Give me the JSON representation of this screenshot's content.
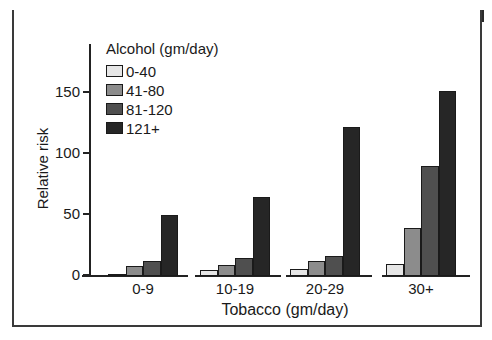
{
  "chart_data": {
    "type": "bar",
    "title": "",
    "xlabel": "Tobacco (gm/day)",
    "ylabel": "Relative risk",
    "ylim": [
      0,
      185
    ],
    "yticks": [
      0,
      50,
      100,
      150
    ],
    "grid": false,
    "legend_position": "top-left",
    "legend_title": "Alcohol (gm/day)",
    "categories": [
      "0-9",
      "10-19",
      "20-29",
      "30+"
    ],
    "series": [
      {
        "name": "0-40",
        "color": "#e6e6e6",
        "values": [
          1,
          5,
          6,
          10
        ]
      },
      {
        "name": "41-80",
        "color": "#8c8c8c",
        "values": [
          8,
          9,
          12,
          39
        ]
      },
      {
        "name": "81-120",
        "color": "#4f4f4f",
        "values": [
          12,
          15,
          16,
          90
        ]
      },
      {
        "name": "121+",
        "color": "#262626",
        "values": [
          50,
          65,
          122,
          152
        ]
      }
    ]
  },
  "labels": {
    "ylabel": "Relative risk",
    "xlabel": "Tobacco (gm/day)",
    "legend_title": "Alcohol (gm/day)",
    "ticks": [
      "0",
      "50",
      "100",
      "150"
    ],
    "categories": [
      "0-9",
      "10-19",
      "20-29",
      "30+"
    ],
    "legend": [
      "0-40",
      "41-80",
      "81-120",
      "121+"
    ]
  }
}
